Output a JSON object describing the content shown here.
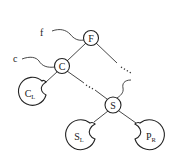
{
  "diagram": {
    "type": "binary-tree",
    "nodes": [
      {
        "id": "F",
        "label": "F",
        "kind": "node"
      },
      {
        "id": "C",
        "label": "C",
        "kind": "node"
      },
      {
        "id": "S",
        "label": "S",
        "kind": "node"
      },
      {
        "id": "CL",
        "label": "C",
        "subscript": "L",
        "kind": "subtree"
      },
      {
        "id": "SL",
        "label": "S",
        "subscript": "L",
        "kind": "subtree"
      },
      {
        "id": "PR",
        "label": "P",
        "subscript": "R",
        "kind": "subtree"
      }
    ],
    "pointers": [
      {
        "label": "f",
        "target": "F"
      },
      {
        "label": "c",
        "target": "C"
      },
      {
        "label": "",
        "target": "S"
      }
    ],
    "edges": [
      {
        "from": "F",
        "to": "C",
        "style": "solid"
      },
      {
        "from": "F",
        "to": "…",
        "style": "solid-then-dotted"
      },
      {
        "from": "C",
        "to": "CL",
        "style": "solid"
      },
      {
        "from": "C",
        "to": "S",
        "style": "dotted-path"
      },
      {
        "from": "S",
        "to": "SL",
        "style": "solid"
      },
      {
        "from": "S",
        "to": "PR",
        "style": "solid"
      }
    ],
    "colors": {
      "stroke": "#222222",
      "background": "#ffffff"
    }
  }
}
